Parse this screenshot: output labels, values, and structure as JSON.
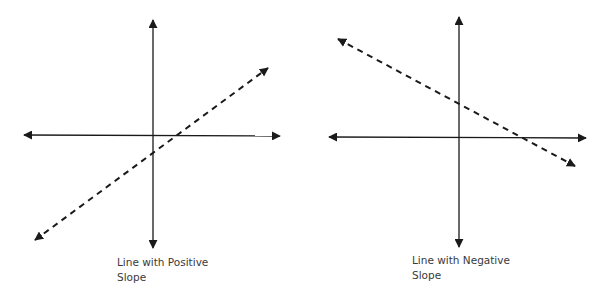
{
  "diagrams": [
    {
      "id": "positive",
      "label_line1": "Line with Positive",
      "label_line2": "Slope",
      "slope_sign": "positive",
      "axes": {
        "origin": [
          153,
          135
        ],
        "x_range": [
          23,
          280
        ],
        "y_range": [
          20,
          248
        ]
      },
      "line": {
        "start": [
          35,
          240
        ],
        "end": [
          268,
          68
        ],
        "style": "dashed",
        "arrowheads": "both"
      }
    },
    {
      "id": "negative",
      "label_line1": "Line with Negative",
      "label_line2": "Slope",
      "slope_sign": "negative",
      "axes": {
        "origin": [
          459,
          137
        ],
        "x_range": [
          329,
          586
        ],
        "y_range": [
          17,
          247
        ]
      },
      "line": {
        "start": [
          338,
          39
        ],
        "end": [
          575,
          166
        ],
        "style": "dashed",
        "arrowheads": "both"
      }
    }
  ],
  "colors": {
    "stroke": "#1a1a1a",
    "label": "#3a3a3a",
    "background": "#ffffff"
  }
}
